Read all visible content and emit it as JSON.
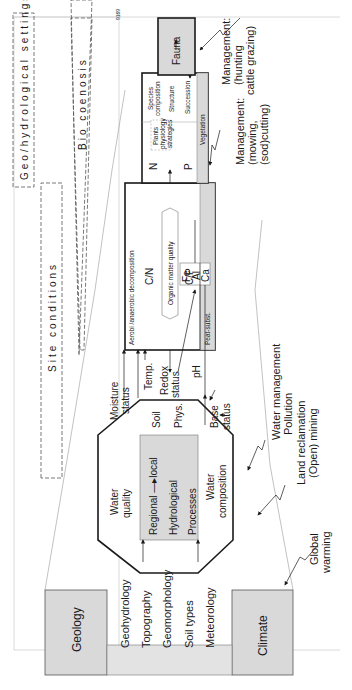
{
  "figure_id": "9169",
  "orientation": "rotated-90-ccw",
  "bands": {
    "geo_hydrological": "Geo/hydrological settings",
    "site_conditions": "Site conditions",
    "bio_coenosis": "Bio coenosis"
  },
  "boxes": {
    "geology": "Geology",
    "climate": "Climate",
    "fauna": "Fauna"
  },
  "drivers": [
    "Geohydrology",
    "Topography",
    "Geomorphology",
    "Soil types",
    "Meteorology"
  ],
  "octagon": {
    "water_quality": [
      "Water",
      "quality"
    ],
    "center": [
      "Regional —▸local",
      "Hydrological",
      "Processes"
    ],
    "soil": [
      "Soil",
      "Phys."
    ],
    "water_composition": [
      "Water",
      "composition"
    ]
  },
  "site": {
    "moisture": [
      "Moisture",
      "status"
    ],
    "temp": "Temp.",
    "redox": [
      "Redox",
      "status"
    ],
    "ph": "pH",
    "base": [
      "Base",
      "status"
    ],
    "metals": [
      "Fe",
      "Al",
      "Ca"
    ]
  },
  "decomposition_box": {
    "title": "Aerobi /anaerobic decomposition",
    "cn": "C/N",
    "om": "Organic matter quality",
    "cp": "C/P",
    "strip": "Peat-subst."
  },
  "vegetation_box": {
    "n": "N",
    "p": "P",
    "plants": [
      "Plants",
      "physiology",
      "strategies"
    ],
    "species": [
      "Species",
      "composition"
    ],
    "structure": "Structure",
    "succession": "Succession",
    "strip": "Vegetation"
  },
  "management": {
    "fauna": [
      "Management:",
      "(hunting",
      "cattle grazing)"
    ],
    "vegetation": [
      "Management:",
      "(mowing,",
      "(sod)cutting)"
    ],
    "water": [
      "Water management",
      "Pollution"
    ],
    "land": [
      "Land reclamation",
      "(Open) mining"
    ],
    "global": [
      "Global",
      "warming"
    ]
  },
  "colors": {
    "box_fill": "#d9d9d9",
    "line": "#1a1a1a",
    "faint": "#9a9a9a"
  }
}
